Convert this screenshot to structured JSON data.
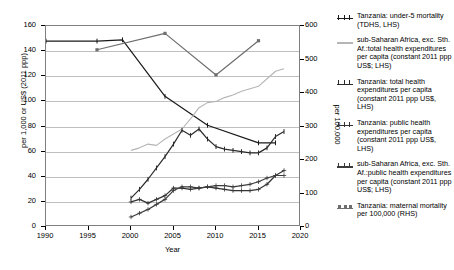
{
  "chart_data": {
    "type": "line",
    "title": "",
    "xlabel": "Year",
    "ylabel_left": "per 1,000 or US$ (2011 ppp)",
    "ylabel_right": "per 100,000",
    "xlim": [
      1990,
      2020
    ],
    "ylim_left": [
      0,
      160
    ],
    "ylim_right": [
      0,
      600
    ],
    "xticks": [
      1990,
      1995,
      2000,
      2005,
      2010,
      2015,
      2020
    ],
    "yticks_left": [
      0,
      20,
      40,
      60,
      80,
      100,
      120,
      140,
      160
    ],
    "yticks_right": [
      0,
      100,
      200,
      300,
      400,
      500,
      600
    ],
    "grid": "horizontal",
    "legend_position": "right",
    "series": [
      {
        "name": "Tanzania: under-5 mortality (TDHS, LHS)",
        "axis": "left",
        "color": "#1a1a1a",
        "marker": "dash",
        "x": [
          1990,
          1996,
          1999,
          2004,
          2009,
          2015,
          2017
        ],
        "y": [
          148,
          148,
          149,
          104,
          81,
          67,
          67
        ]
      },
      {
        "name": "sub-Saharan Africa, exc. Sth. Af.:total health expenditures per capita (constant 2011 ppp US$; LHS)",
        "axis": "left",
        "color": "#b5b5b5",
        "marker": "none",
        "x": [
          2000,
          2001,
          2002,
          2003,
          2004,
          2005,
          2006,
          2007,
          2008,
          2009,
          2010,
          2011,
          2012,
          2013,
          2014,
          2015,
          2016,
          2017,
          2018
        ],
        "y": [
          61,
          63,
          66,
          65,
          70,
          74,
          78,
          86,
          95,
          99,
          100,
          103,
          105,
          108,
          110,
          112,
          118,
          124,
          126
        ]
      },
      {
        "name": "Tanzania: total health expenditures per capita (constant 2011 ppp US$, LHS)",
        "axis": "left",
        "color": "#2b2b2b",
        "marker": "dash",
        "x": [
          2000,
          2001,
          2002,
          2003,
          2004,
          2005,
          2006,
          2007,
          2008,
          2009,
          2010,
          2011,
          2012,
          2013,
          2014,
          2015,
          2016,
          2017,
          2018
        ],
        "y": [
          23,
          30,
          38,
          47,
          56,
          66,
          77,
          73,
          78,
          70,
          64,
          62,
          61,
          60,
          59,
          59,
          63,
          72,
          76
        ]
      },
      {
        "name": "Tanzania: public health expenditures per capita (constant 2011 ppp US$, LHS)",
        "axis": "left",
        "color": "#333333",
        "marker": "cross",
        "x": [
          2000,
          2001,
          2002,
          2003,
          2004,
          2005,
          2006,
          2007,
          2008,
          2009,
          2010,
          2011,
          2012,
          2013,
          2014,
          2015,
          2016,
          2017,
          2018
        ],
        "y": [
          20,
          22,
          19,
          22,
          25,
          31,
          31,
          30,
          31,
          32,
          31,
          30,
          29,
          29,
          29,
          30,
          34,
          41,
          45
        ]
      },
      {
        "name": "sub-Saharan Africa, exc. Sth. Af.:public health expenditures per capita (constant 2011 ppp US$; LHS)",
        "axis": "left",
        "color": "#3c3c3c",
        "marker": "cross",
        "x": [
          2000,
          2001,
          2002,
          2003,
          2004,
          2005,
          2006,
          2007,
          2008,
          2009,
          2010,
          2011,
          2012,
          2013,
          2014,
          2015,
          2016,
          2017,
          2018
        ],
        "y": [
          8,
          11,
          14,
          18,
          22,
          29,
          32,
          32,
          31,
          32,
          33,
          33,
          32,
          33,
          34,
          36,
          39,
          41,
          41
        ]
      },
      {
        "name": "Tanzania: maternal mortality per 100,000 (RHS)",
        "axis": "right",
        "color": "#6e6e6e",
        "marker": "square",
        "x": [
          1996,
          2004,
          2010,
          2015
        ],
        "y": [
          529,
          578,
          454,
          556
        ]
      }
    ]
  },
  "legend": {
    "items": [
      {
        "label": "Tanzania: under-5 mortality (TDHS, LHS)",
        "color": "#1a1a1a",
        "marker": "dash"
      },
      {
        "label": "sub-Saharan Africa, exc. Sth. Af.:total health expenditures per capita (constant 2011 ppp US$; LHS)",
        "color": "#b5b5b5",
        "marker": "none"
      },
      {
        "label": "Tanzania: total health expenditures per capita (constant 2011 ppp US$, LHS)",
        "color": "#2b2b2b",
        "marker": "dash"
      },
      {
        "label": "Tanzania: public health expenditures per capita (constant 2011 ppp US$, LHS)",
        "color": "#333333",
        "marker": "cross"
      },
      {
        "label": "sub-Saharan Africa, exc. Sth. Af.:public health expenditures per capita (constant 2011 ppp US$; LHS)",
        "color": "#3c3c3c",
        "marker": "cross"
      },
      {
        "label": "Tanzania: maternal mortality per 100,000 (RHS)",
        "color": "#6e6e6e",
        "marker": "square"
      }
    ]
  },
  "axes": {
    "x_title": "Year",
    "y_left_title": "per 1,000 or US$ (2011 ppp)",
    "y_right_title": "per 100,000"
  }
}
